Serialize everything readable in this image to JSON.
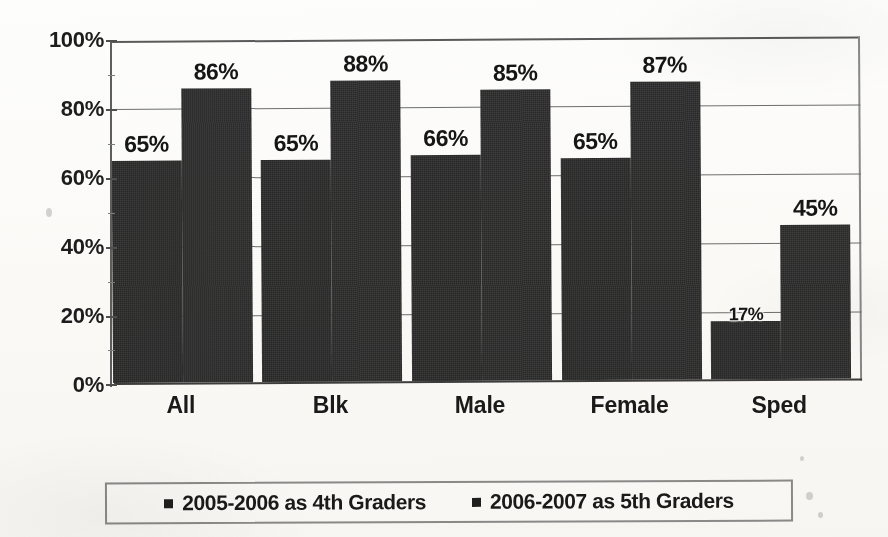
{
  "chart_data": {
    "type": "bar",
    "title": "",
    "subtitle": "",
    "xlabel": "",
    "ylabel": "",
    "categories": [
      "All",
      "Blk",
      "Male",
      "Female",
      "Sped"
    ],
    "series": [
      {
        "name": "2005-2006 as 4th Graders",
        "values": [
          65,
          65,
          66,
          65,
          17
        ],
        "labels": [
          "65%",
          "65%",
          "66%",
          "65%",
          "17%"
        ],
        "color": "#262626"
      },
      {
        "name": "2006-2007 as 5th Graders",
        "values": [
          86,
          88,
          85,
          87,
          45
        ],
        "labels": [
          "86%",
          "88%",
          "85%",
          "87%",
          "45%"
        ],
        "color": "#282828"
      }
    ],
    "ylim": [
      0,
      100
    ],
    "y_ticks": [
      0,
      20,
      40,
      60,
      80,
      100
    ],
    "y_tick_labels": [
      "0%",
      "20%",
      "40%",
      "60%",
      "80%",
      "100%"
    ],
    "y_minor_ticks": [
      10,
      30,
      50,
      70,
      90
    ],
    "grid": true,
    "grid_axis": "y",
    "legend_position": "bottom",
    "value_labels": true
  },
  "axis": {
    "y_tick_labels": [
      "100%",
      "80%",
      "60%",
      "40%",
      "20%",
      "0%"
    ],
    "x_tick_labels": [
      "All",
      "Blk",
      "Male",
      "Female",
      "Sped"
    ]
  },
  "legend": {
    "entries": [
      {
        "label": "2005-2006 as 4th Graders",
        "marker": "square-marker"
      },
      {
        "label": "2006-2007 as 5th Graders",
        "marker": "square-marker"
      }
    ]
  }
}
